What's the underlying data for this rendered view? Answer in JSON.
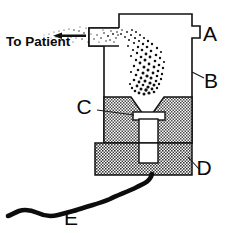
{
  "figure": {
    "background_color": "#ffffff",
    "ink_color": "#121212",
    "width": 232,
    "height": 233,
    "caption_label": "To Patient",
    "labels": [
      {
        "key": "A",
        "text": "A",
        "x": 210,
        "y": 41,
        "target": "chamber-top-body"
      },
      {
        "key": "B",
        "text": "B",
        "x": 211,
        "y": 88,
        "target": "chamber-side-wall"
      },
      {
        "key": "C",
        "text": "C",
        "x": 84,
        "y": 114,
        "target": "nozzle-tube-top"
      },
      {
        "key": "D",
        "text": "D",
        "x": 204,
        "y": 175,
        "target": "base-block"
      },
      {
        "key": "E",
        "text": "E",
        "x": 71,
        "y": 225,
        "target": "supply-tubing"
      }
    ],
    "flow": {
      "direction": "left",
      "arrow_name": "aerosol-flow-arrow",
      "spray_name": "aerosol-particle-spray"
    },
    "parts": {
      "outlet_tube": "outlet-tube",
      "chamber": "medication-chamber",
      "notch": "chamber-side-notch",
      "funnel_block": "baffle-funnel-block",
      "nozzle": "nozzle-tube",
      "base": "base-block",
      "tubing": "supply-tubing"
    }
  }
}
